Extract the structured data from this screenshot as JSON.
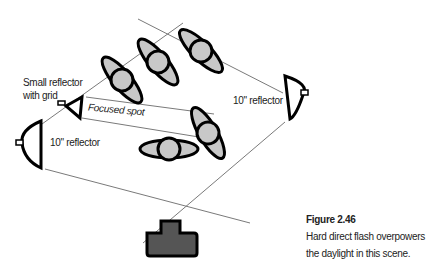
{
  "diagram": {
    "labels": {
      "small_reflector": "Small reflector",
      "small_reflector_line2": "with grid",
      "focused_spot": "Focused spot",
      "reflector_right": "10\" reflector",
      "reflector_left": "10\" reflector"
    },
    "caption": {
      "title": "Figure 2.46",
      "text": "Hard direct flash overpowers the daylight in this scene."
    },
    "people_count": 6,
    "colors": {
      "person_fill": "#c8c8c8",
      "outline": "#000000",
      "line": "#777777",
      "camera_fill": "#555555"
    }
  }
}
